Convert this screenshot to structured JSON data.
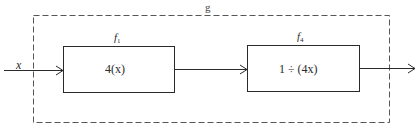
{
  "diagram": {
    "outer_function": {
      "label": "g",
      "style": "dashed"
    },
    "input": {
      "label": "x"
    },
    "blocks": [
      {
        "name": "f",
        "subscript": "1",
        "expression": "4(x)"
      },
      {
        "name": "f",
        "subscript": "4",
        "expression": "1 ÷ (4x)"
      }
    ],
    "edges": [
      {
        "from": "input",
        "to": "block-1"
      },
      {
        "from": "block-1",
        "to": "block-2"
      },
      {
        "from": "block-2",
        "to": "output"
      }
    ],
    "colors": {
      "stroke": "#2a2a2a",
      "dashed_stroke": "#555555",
      "background": "#ffffff"
    }
  }
}
